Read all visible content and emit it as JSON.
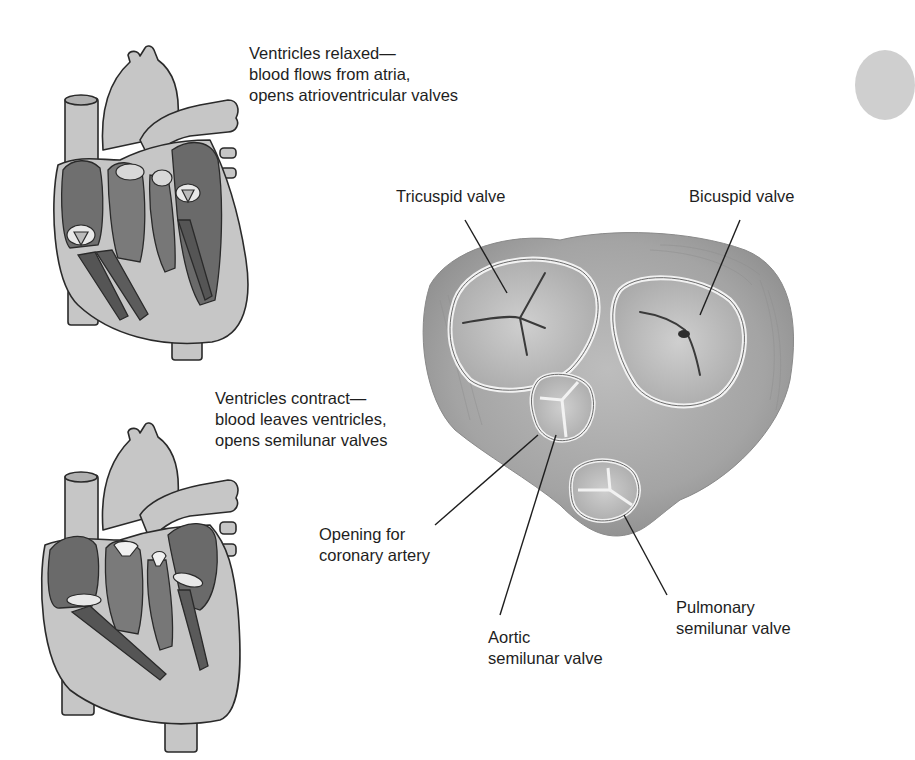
{
  "figure": {
    "type": "anatomical-diagram"
  },
  "panels": {
    "relaxed": {
      "lines": [
        "Ventricles relaxed—",
        "blood flows from atria,",
        "opens atrioventricular valves"
      ]
    },
    "contract": {
      "lines": [
        "Ventricles contract—",
        "blood leaves ventricles,",
        "opens semilunar valves"
      ]
    }
  },
  "valve_view": {
    "labels": {
      "tricuspid": [
        "Tricuspid valve"
      ],
      "bicuspid": [
        "Bicuspid valve"
      ],
      "coronary": [
        "Opening for",
        "coronary artery"
      ],
      "aortic": [
        "Aortic",
        "semilunar valve"
      ],
      "pulmonary": [
        "Pulmonary",
        "semilunar valve"
      ]
    }
  },
  "colors": {
    "background": "#ffffff",
    "text": "#1e1e1e",
    "tissue_light": "#c8c8c8",
    "tissue_mid": "#9a9a9a",
    "tissue_dark": "#5e5e5e",
    "outline": "#2a2a2a"
  }
}
